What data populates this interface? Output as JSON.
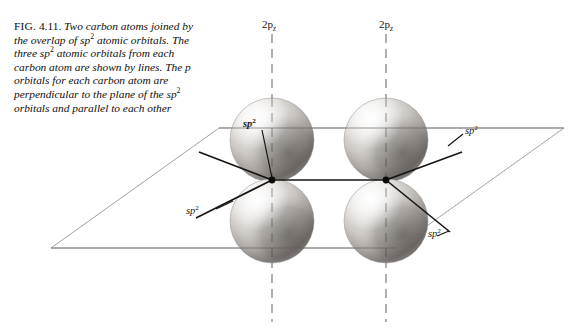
{
  "figure": {
    "number_label": "FIG.",
    "number": "4.11.",
    "caption_parts": {
      "p1": "Two carbon atoms joined by the overlap of sp",
      "p1_sup": "2",
      "p2": " atomic orbitals. The three sp",
      "p2_sup": "2",
      "p3": " atomic orbitals from each carbon atom are shown by lines. The p orbitals for each carbon atom are perpendicular to the plane of the sp",
      "p3_sup": "2",
      "p4": " orbitals and parallel to each other"
    },
    "caption_full": "FIG. 4.11. Two carbon atoms joined by the overlap of sp2 atomic orbitals. The three sp2 atomic orbitals from each carbon atom are shown by lines. The p orbitals for each carbon atom are perpendicular to the plane of the sp2 orbitals and parallel to each other"
  },
  "diagram": {
    "type": "molecular-orbital-illustration",
    "axis_labels": [
      {
        "id": "2pz-left",
        "text_main": "2p",
        "text_sub": "z"
      },
      {
        "id": "2pz-right",
        "text_main": "2p",
        "text_sub": "z"
      }
    ],
    "orbital_labels": [
      {
        "id": "sp2-upper-left",
        "text": "sp",
        "sup": "2"
      },
      {
        "id": "sp2-upper-right",
        "text": "sp",
        "sup": "2"
      },
      {
        "id": "sp2-lower-left",
        "text": "sp",
        "sup": "2"
      },
      {
        "id": "sp2-lower-right",
        "text": "sp",
        "sup": "2"
      }
    ],
    "colors": {
      "background": "#ffffff",
      "ink": "#1a1713",
      "plane_line": "#9a9a9a",
      "dashed_axis": "#6f6f6f",
      "sphere_light": "#f2f0ee",
      "sphere_mid": "#b9b5b1",
      "sphere_dark": "#4a4744"
    },
    "atoms": [
      {
        "id": "carbon-left",
        "cx": 272,
        "cy": 180
      },
      {
        "id": "carbon-right",
        "cx": 386,
        "cy": 180
      }
    ],
    "spheres": [
      {
        "id": "p-lobe-upper-left",
        "cx": 272,
        "cy": 140,
        "r": 42
      },
      {
        "id": "p-lobe-lower-left",
        "cx": 272,
        "cy": 221,
        "r": 42
      },
      {
        "id": "p-lobe-upper-right",
        "cx": 386,
        "cy": 140,
        "r": 42
      },
      {
        "id": "p-lobe-lower-right",
        "cx": 386,
        "cy": 221,
        "r": 42
      }
    ],
    "plane_polygon": "51,248 219,128 564,128 396,248"
  }
}
